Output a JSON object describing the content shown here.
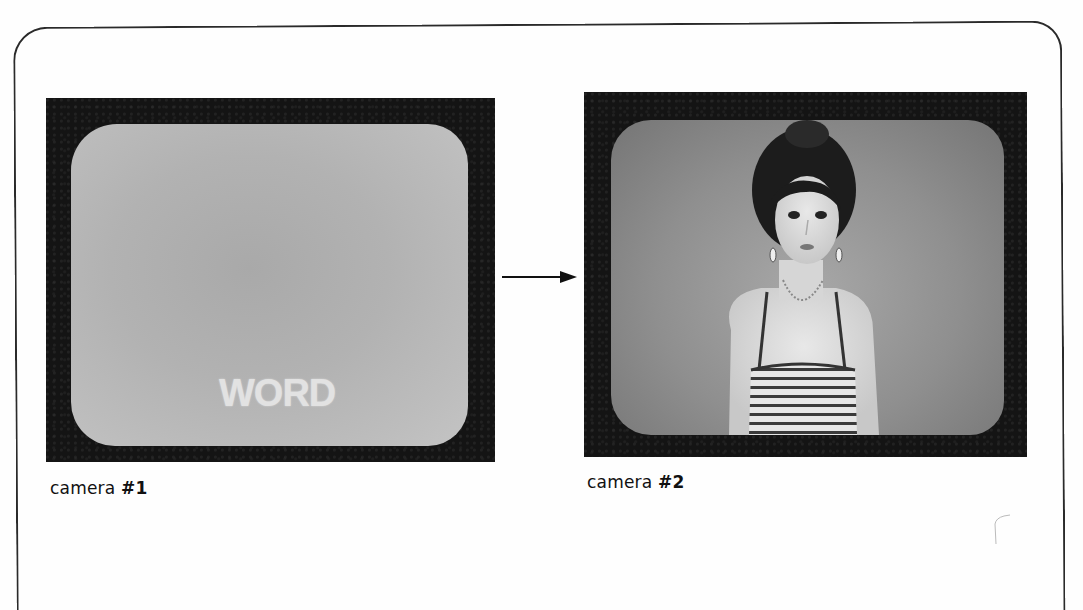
{
  "figure": {
    "panels": [
      {
        "id": "camera-1",
        "label_prefix": "camera ",
        "label_number": "#1",
        "screen_text": "WORD",
        "screen_content": "blank gray screen with superimposed word"
      },
      {
        "id": "camera-2",
        "label_prefix": "camera ",
        "label_number": "#2",
        "screen_text": "",
        "screen_content": "woman in striped tank top with necklace and earrings"
      }
    ],
    "connector": "right-arrow",
    "colors": {
      "monitor_bezel": "#141414",
      "screen_gray": "#b0b0b0",
      "frame_line": "#2a2a2a",
      "background": "#fefefe"
    }
  }
}
